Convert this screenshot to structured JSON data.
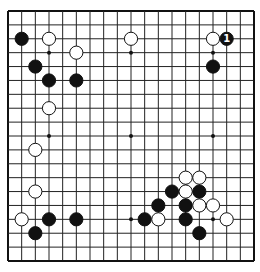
{
  "board": {
    "size": 19,
    "origin_x": 8,
    "origin_y": 11,
    "step_x": 13.667,
    "step_y": 13.889,
    "line_color": "#222222",
    "border_color": "#111111",
    "star_points": [
      [
        3,
        3
      ],
      [
        3,
        9
      ],
      [
        3,
        15
      ],
      [
        9,
        3
      ],
      [
        9,
        9
      ],
      [
        9,
        15
      ],
      [
        15,
        3
      ],
      [
        15,
        9
      ],
      [
        15,
        15
      ]
    ],
    "stones": [
      {
        "color": "black",
        "col": 1,
        "row": 2
      },
      {
        "color": "white",
        "col": 3,
        "row": 2
      },
      {
        "color": "white",
        "col": 9,
        "row": 2
      },
      {
        "color": "white",
        "col": 15,
        "row": 2
      },
      {
        "color": "black",
        "col": 16,
        "row": 2,
        "label": "1"
      },
      {
        "color": "white",
        "col": 5,
        "row": 3
      },
      {
        "color": "black",
        "col": 2,
        "row": 4
      },
      {
        "color": "black",
        "col": 15,
        "row": 4
      },
      {
        "color": "black",
        "col": 3,
        "row": 5
      },
      {
        "color": "black",
        "col": 5,
        "row": 5
      },
      {
        "color": "white",
        "col": 3,
        "row": 7
      },
      {
        "color": "white",
        "col": 2,
        "row": 10
      },
      {
        "color": "white",
        "col": 2,
        "row": 13
      },
      {
        "color": "white",
        "col": 13,
        "row": 12
      },
      {
        "color": "white",
        "col": 14,
        "row": 12
      },
      {
        "color": "black",
        "col": 12,
        "row": 13
      },
      {
        "color": "white",
        "col": 13,
        "row": 13
      },
      {
        "color": "black",
        "col": 14,
        "row": 13
      },
      {
        "color": "black",
        "col": 11,
        "row": 14
      },
      {
        "color": "black",
        "col": 13,
        "row": 14
      },
      {
        "color": "white",
        "col": 14,
        "row": 14
      },
      {
        "color": "white",
        "col": 15,
        "row": 14
      },
      {
        "color": "white",
        "col": 1,
        "row": 15
      },
      {
        "color": "black",
        "col": 3,
        "row": 15
      },
      {
        "color": "black",
        "col": 5,
        "row": 15
      },
      {
        "color": "black",
        "col": 10,
        "row": 15
      },
      {
        "color": "white",
        "col": 11,
        "row": 15
      },
      {
        "color": "black",
        "col": 13,
        "row": 15
      },
      {
        "color": "white",
        "col": 16,
        "row": 15
      },
      {
        "color": "black",
        "col": 2,
        "row": 16
      },
      {
        "color": "black",
        "col": 14,
        "row": 16
      }
    ]
  }
}
